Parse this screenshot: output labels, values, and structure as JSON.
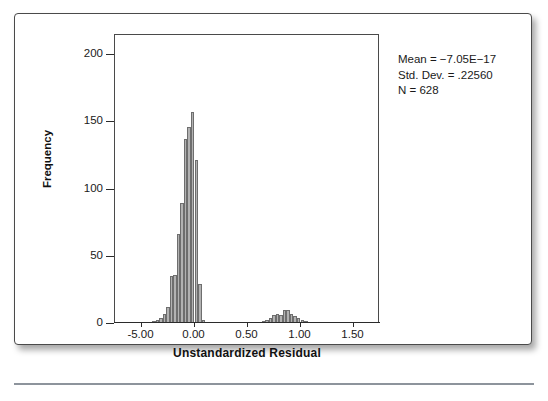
{
  "chart_data": {
    "type": "bar",
    "title": "",
    "subtitle": "",
    "xlabel": "Unstandardized Residual",
    "ylabel": "Frequency",
    "xlim": [
      -0.75,
      1.75
    ],
    "ylim": [
      0,
      215
    ],
    "x_ticks": [
      "-5.00",
      "0.00",
      "0.50",
      "1.00",
      "1.50"
    ],
    "x_tick_values": [
      -0.5,
      0.0,
      0.5,
      1.0,
      1.5
    ],
    "y_ticks": [
      "0",
      "50",
      "100",
      "150",
      "200"
    ],
    "y_tick_values": [
      0,
      50,
      100,
      150,
      200
    ],
    "grid": false,
    "legend": "none",
    "bar_fill": "#b2b2b2",
    "bar_border": "#6e6e6e",
    "bin_width": 0.0333,
    "bins": [
      {
        "x": -0.383,
        "value": 1
      },
      {
        "x": -0.35,
        "value": 2
      },
      {
        "x": -0.317,
        "value": 4
      },
      {
        "x": -0.283,
        "value": 7
      },
      {
        "x": -0.25,
        "value": 12
      },
      {
        "x": -0.217,
        "value": 35
      },
      {
        "x": -0.183,
        "value": 36
      },
      {
        "x": -0.15,
        "value": 66
      },
      {
        "x": -0.117,
        "value": 89
      },
      {
        "x": -0.083,
        "value": 137
      },
      {
        "x": -0.05,
        "value": 146
      },
      {
        "x": -0.017,
        "value": 157
      },
      {
        "x": 0.017,
        "value": 121
      },
      {
        "x": 0.05,
        "value": 29
      },
      {
        "x": 0.083,
        "value": 2
      },
      {
        "x": 0.65,
        "value": 1
      },
      {
        "x": 0.683,
        "value": 2
      },
      {
        "x": 0.717,
        "value": 4
      },
      {
        "x": 0.75,
        "value": 6
      },
      {
        "x": 0.783,
        "value": 7
      },
      {
        "x": 0.817,
        "value": 6
      },
      {
        "x": 0.85,
        "value": 10
      },
      {
        "x": 0.883,
        "value": 10
      },
      {
        "x": 0.917,
        "value": 7
      },
      {
        "x": 0.95,
        "value": 5
      },
      {
        "x": 0.983,
        "value": 4
      },
      {
        "x": 1.017,
        "value": 2
      },
      {
        "x": 1.05,
        "value": 1
      }
    ],
    "annotations": {
      "mean": "Mean = −7.05E−17",
      "std_dev": "Std. Dev. = .22560",
      "n": "N = 628"
    }
  }
}
